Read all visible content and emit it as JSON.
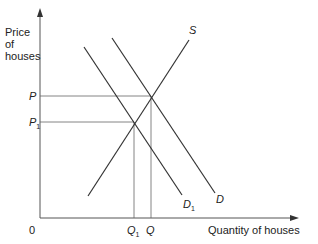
{
  "diagram": {
    "type": "supply-demand",
    "y_axis_label": [
      "Price",
      "of",
      "houses"
    ],
    "x_axis_label": "Quantity of houses",
    "origin_label": "0",
    "price_labels": {
      "p": "P",
      "p1": "P",
      "p1_sub": "1"
    },
    "quantity_labels": {
      "q": "Q",
      "q1": "Q",
      "q1_sub": "1"
    },
    "curves": [
      {
        "name": "S",
        "label": "S"
      },
      {
        "name": "D",
        "label": "D"
      },
      {
        "name": "D1",
        "label": "D",
        "sub": "1"
      }
    ],
    "colors": {
      "line": "#333333",
      "axis": "#555555",
      "guide": "#666666"
    }
  }
}
